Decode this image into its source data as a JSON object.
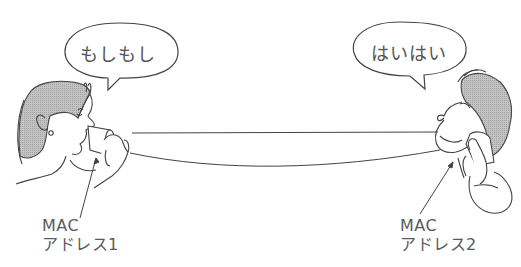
{
  "speech": {
    "left": "もしもし",
    "right": "はいはい"
  },
  "labels": {
    "left": {
      "line1": "MAC",
      "line2": "アドレス1"
    },
    "right": {
      "line1": "MAC",
      "line2": "アドレス2"
    }
  },
  "figures": {
    "left": "woman-speaking-into-cup-phone",
    "right": "man-listening-to-cup-phone"
  },
  "colors": {
    "line": "#444444",
    "hair_shade": "#b5b5b5",
    "text": "#5a5a5a"
  }
}
